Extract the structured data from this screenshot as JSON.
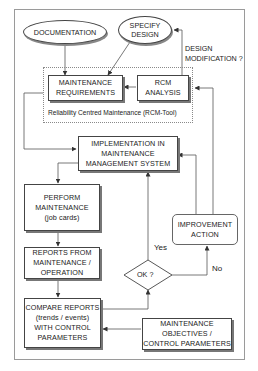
{
  "diagram": {
    "type": "flowchart",
    "nodes": {
      "documentation": {
        "label": "DOCUMENTATION",
        "shape": "ellipse"
      },
      "specify_design": {
        "line1": "SPECIFY",
        "line2": "DESIGN",
        "shape": "ellipse"
      },
      "maintenance_requirements": {
        "line1": "MAINTENANCE",
        "line2": "REQUIREMENTS"
      },
      "rcm_analysis": {
        "line1": "RCM",
        "line2": "ANALYSIS"
      },
      "rcm_group_caption": "Reliability Centred Maintenance (RCM-Tool)",
      "implementation": {
        "line1": "IMPLEMENTATION IN",
        "line2": "MAINTENANCE",
        "line3": "MANAGEMENT SYSTEM"
      },
      "perform_maintenance": {
        "line1": "PERFORM",
        "line2": "MAINTENANCE",
        "line3": "(job cards)"
      },
      "reports": {
        "line1": "REPORTS FROM",
        "line2": "MAINTENANCE /",
        "line3": "OPERATION"
      },
      "compare_reports": {
        "line1": "COMPARE REPORTS",
        "line2": "(trends / events)",
        "line3": "WITH CONTROL",
        "line4": "PARAMETERS"
      },
      "decision": {
        "label": "OK ?"
      },
      "improvement_action": {
        "line1": "IMPROVEMENT",
        "line2": "ACTION"
      },
      "objectives": {
        "line1": "MAINTENANCE",
        "line2": "OBJECTIVES /",
        "line3": "CONTROL PARAMETERS"
      }
    },
    "edge_labels": {
      "design_modification_1": "DESIGN",
      "design_modification_2": "MODIFICATION ?",
      "yes": "Yes",
      "no": "No"
    },
    "edges": [
      [
        "documentation",
        "maintenance_requirements"
      ],
      [
        "specify_design",
        "maintenance_requirements"
      ],
      [
        "rcm_analysis",
        "maintenance_requirements"
      ],
      [
        "rcm_analysis",
        "specify_design",
        "DESIGN MODIFICATION ?"
      ],
      [
        "maintenance_requirements",
        "implementation"
      ],
      [
        "implementation",
        "perform_maintenance"
      ],
      [
        "perform_maintenance",
        "reports"
      ],
      [
        "reports",
        "compare_reports"
      ],
      [
        "compare_reports",
        "decision"
      ],
      [
        "objectives",
        "compare_reports"
      ],
      [
        "decision",
        "implementation",
        "Yes"
      ],
      [
        "decision",
        "improvement_action",
        "No"
      ],
      [
        "improvement_action",
        "implementation"
      ],
      [
        "improvement_action",
        "rcm_analysis"
      ]
    ]
  }
}
